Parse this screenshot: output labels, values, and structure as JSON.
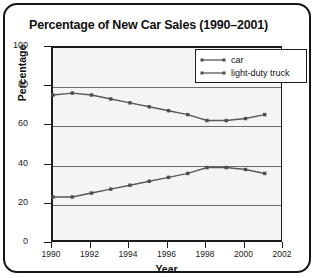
{
  "chart_data": {
    "type": "line",
    "title": "Percentage of New Car Sales (1990–2001)",
    "xlabel": "Year",
    "ylabel": "Percentage",
    "xlim": [
      1990,
      2002
    ],
    "ylim": [
      0,
      100
    ],
    "grid": true,
    "legend_position": "top-right",
    "x": [
      1990,
      1991,
      1992,
      1993,
      1994,
      1995,
      1996,
      1997,
      1998,
      1999,
      2000,
      2001
    ],
    "xticks": [
      "1990",
      "1992",
      "1994",
      "1996",
      "1998",
      "2000",
      "2002"
    ],
    "xtick_values": [
      1990,
      1992,
      1994,
      1996,
      1998,
      2000,
      2002
    ],
    "yticks": [
      "0",
      "20",
      "40",
      "60",
      "80",
      "100"
    ],
    "ytick_values": [
      0,
      20,
      40,
      60,
      80,
      100
    ],
    "series": [
      {
        "name": "car",
        "color": "#595959",
        "values": [
          76,
          77,
          76,
          74,
          72,
          70,
          68,
          66,
          63,
          63,
          64,
          66
        ]
      },
      {
        "name": "light-duty truck",
        "color": "#595959",
        "values": [
          24,
          24,
          26,
          28,
          30,
          32,
          34,
          36,
          39,
          39,
          38,
          36
        ]
      }
    ]
  },
  "legend": {
    "items": [
      {
        "label": "car"
      },
      {
        "label": "light-duty truck"
      }
    ]
  }
}
